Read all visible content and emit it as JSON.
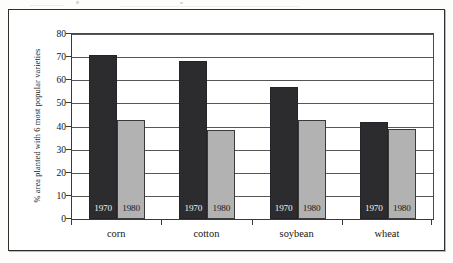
{
  "figure": {
    "frame_color": "#2e2e2e",
    "background": "#ffffff"
  },
  "chart_data": {
    "type": "bar",
    "title": "",
    "subtitle": "",
    "xlabel": "",
    "ylabel": "% area planted with 6 most popular varieties",
    "categories": [
      "corn",
      "cotton",
      "soybean",
      "wheat"
    ],
    "series": [
      {
        "name": "1970",
        "color": "#2c2c2e",
        "values": [
          71,
          68.5,
          57,
          42
        ]
      },
      {
        "name": "1980",
        "color": "#b2b2b2",
        "values": [
          43,
          38.5,
          43,
          39
        ]
      }
    ],
    "ylim": [
      0,
      80
    ],
    "yticks": [
      0,
      10,
      20,
      30,
      40,
      50,
      60,
      70,
      80
    ],
    "ytick_labels": [
      "0",
      "10",
      "20",
      "30",
      "40",
      "50",
      "60",
      "70",
      "80"
    ],
    "grid": true,
    "grid_axis": "y",
    "legend": "in-bar labels",
    "bar_labels": [
      [
        "1970",
        "1980"
      ],
      [
        "1970",
        "1980"
      ],
      [
        "1970",
        "1980"
      ],
      [
        "1970",
        "1980"
      ]
    ]
  }
}
